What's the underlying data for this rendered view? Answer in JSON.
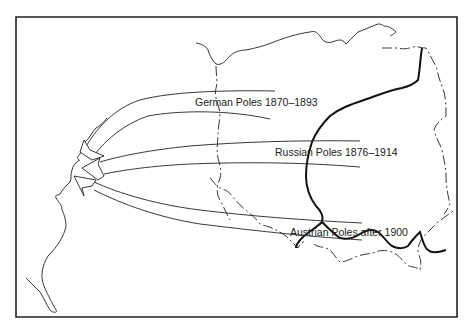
{
  "map": {
    "type": "migration-flow-map",
    "colors": {
      "ink": "#222222",
      "background": "#ffffff"
    },
    "flows": [
      {
        "label": "German Poles  1870–1893"
      },
      {
        "label": "Russian Poles 1876–1914"
      },
      {
        "label": "Austrian Poles after 1900"
      }
    ]
  }
}
